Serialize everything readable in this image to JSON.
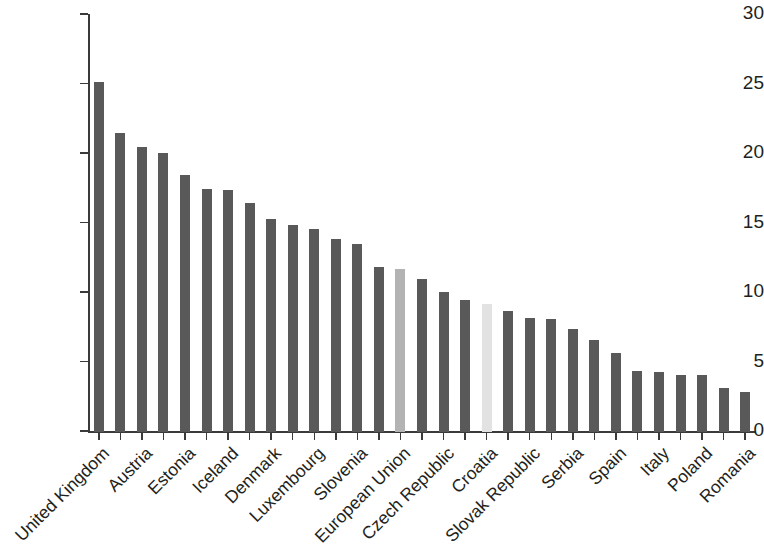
{
  "chart_data": {
    "type": "bar",
    "title": "",
    "subtitle": "",
    "xlabel": "",
    "ylabel": "",
    "ylim": [
      0,
      30
    ],
    "yticks": [
      0,
      5,
      10,
      15,
      20,
      25,
      30
    ],
    "ytick_labels": [
      "0",
      "5",
      "10",
      "15",
      "20",
      "25",
      "30"
    ],
    "grid": false,
    "legend": null,
    "label_interval": 2,
    "bar_colors": {
      "default": "#595959",
      "highlight_primary": "#b3b3b3",
      "highlight_secondary": "#e2e2e2",
      "axis": "#3a3a3a",
      "text": "#231f20",
      "background": "#ffffff"
    },
    "categories": [
      "United Kingdom",
      "",
      "Austria",
      "",
      "Estonia",
      "",
      "Iceland",
      "",
      "Denmark",
      "",
      "Luxembourg",
      "",
      "Slovenia",
      "",
      "European Union",
      "",
      "Czech Republic",
      "",
      "Croatia",
      "",
      "Slovak Republic",
      "",
      "Serbia",
      "",
      "Spain",
      "",
      "Italy",
      "",
      "Poland",
      "",
      "Romania"
    ],
    "visible_tick_labels": [
      "United Kingdom",
      "Austria",
      "Estonia",
      "Iceland",
      "Denmark",
      "Luxembourg",
      "Slovenia",
      "European Union",
      "Czech Republic",
      "Croatia",
      "Slovak Republic",
      "Serbia",
      "Spain",
      "Italy",
      "Poland",
      "Romania"
    ],
    "values": [
      25.2,
      21.5,
      20.5,
      20.1,
      18.5,
      17.5,
      17.4,
      16.5,
      15.3,
      14.9,
      14.6,
      13.9,
      13.5,
      11.9,
      11.7,
      11.0,
      10.1,
      9.5,
      9.2,
      8.7,
      8.2,
      8.1,
      7.4,
      6.6,
      5.7,
      4.4,
      4.3,
      4.1,
      4.1,
      3.2,
      2.9
    ],
    "bar_styles": [
      "default",
      "default",
      "default",
      "default",
      "default",
      "default",
      "default",
      "default",
      "default",
      "default",
      "default",
      "default",
      "default",
      "default",
      "highlight_primary",
      "default",
      "default",
      "default",
      "highlight_secondary",
      "default",
      "default",
      "default",
      "default",
      "default",
      "default",
      "default",
      "default",
      "default",
      "default",
      "default",
      "default"
    ]
  }
}
